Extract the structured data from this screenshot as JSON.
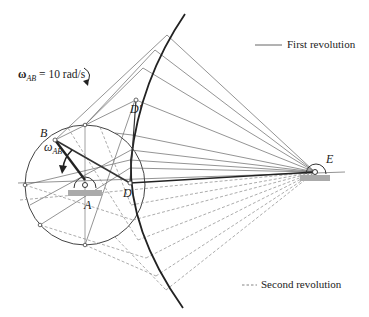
{
  "diagram": {
    "type": "four-bar linkage coupler curve construction",
    "angular_velocity": {
      "symbol": "ω",
      "subscript": "AB",
      "equation_value": "= 10 rad/s",
      "direction": "clockwise"
    },
    "points": {
      "A": "A",
      "B": "B",
      "D": "D",
      "D_prime": "D′",
      "E": "E"
    },
    "omega_label": {
      "symbol": "ω",
      "subscript": "AB"
    },
    "legend": [
      {
        "label": "First revolution",
        "style": "solid"
      },
      {
        "label": "Second revolution",
        "style": "dashed"
      }
    ],
    "colors": {
      "line": "#555555",
      "heavy": "#222222",
      "ground": "#999999"
    }
  }
}
